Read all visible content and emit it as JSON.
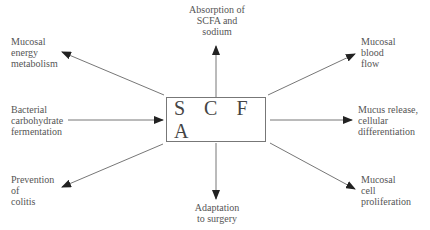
{
  "center": {
    "label": "S C F A"
  },
  "nodes": {
    "top": [
      "Absorption of",
      "SCFA and",
      "sodium"
    ],
    "top_left": [
      "Mucosal",
      "energy",
      "metabolism"
    ],
    "top_right": [
      "Mucosal",
      "blood",
      "flow"
    ],
    "left": [
      "Bacterial",
      "carbohydrate",
      "fermentation"
    ],
    "right": [
      "Mucus release,",
      "cellular",
      "differentiation"
    ],
    "bottom_left": [
      "Prevention",
      "of",
      "colitis"
    ],
    "bottom": [
      "Adaptation",
      "to surgery"
    ],
    "bottom_right": [
      "Mucosal",
      "cell",
      "proliferation"
    ]
  },
  "colors": {
    "line": "#777777",
    "arrowhead": "#222222",
    "text": "#555555"
  }
}
